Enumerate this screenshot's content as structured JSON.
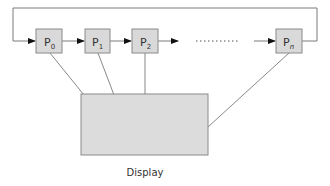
{
  "diagram": {
    "processes": [
      {
        "id": "p0",
        "base": "P",
        "sub": "0"
      },
      {
        "id": "p1",
        "base": "P",
        "sub": "1"
      },
      {
        "id": "p2",
        "base": "P",
        "sub": "2"
      },
      {
        "id": "pn",
        "base": "P",
        "sub": "n"
      }
    ],
    "ellipsis": "..........",
    "display_label": "Display",
    "colors": {
      "box_fill": "#d9d9d9",
      "box_stroke": "#8a8a8a",
      "line": "#7a7a7a",
      "arrow": "#111111",
      "text": "#333333"
    }
  }
}
